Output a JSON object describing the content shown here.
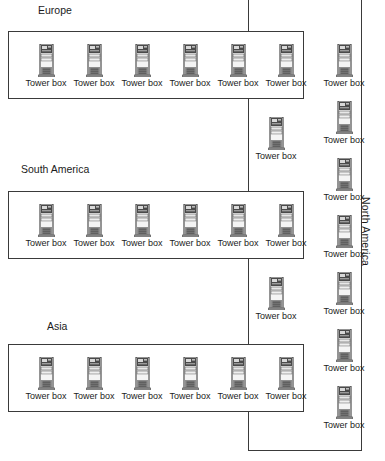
{
  "diagram": {
    "node_icon": "tower-box-icon",
    "node_label": "Tower box",
    "line_color": "#3a3a3a",
    "background": "#ffffff"
  },
  "north_america": {
    "label": "North America",
    "orientation": "vertical",
    "box": {
      "left": 248,
      "top": 0,
      "width": 114,
      "height": 451
    },
    "label_pos": {
      "x": 372,
      "y": 197
    },
    "right_column_nodes": [
      {
        "label": "Tower box",
        "x": 316,
        "y": 44
      },
      {
        "label": "Tower box",
        "x": 316,
        "y": 101
      },
      {
        "label": "Tower box",
        "x": 316,
        "y": 158
      },
      {
        "label": "Tower box",
        "x": 316,
        "y": 215
      },
      {
        "label": "Tower box",
        "x": 316,
        "y": 272
      },
      {
        "label": "Tower box",
        "x": 316,
        "y": 329
      },
      {
        "label": "Tower box",
        "x": 316,
        "y": 386
      }
    ],
    "middle_column_nodes": [
      {
        "label": "Tower box",
        "x": 248,
        "y": 117
      },
      {
        "label": "Tower box",
        "x": 248,
        "y": 277
      }
    ]
  },
  "regions": [
    {
      "name": "Europe",
      "title_pos": {
        "x": 38,
        "y": 4
      },
      "box": {
        "left": 8,
        "top": 31,
        "width": 296,
        "height": 68
      },
      "nodes": [
        {
          "label": "Tower box",
          "x": 9
        },
        {
          "label": "Tower box",
          "x": 57
        },
        {
          "label": "Tower box",
          "x": 105
        },
        {
          "label": "Tower box",
          "x": 153
        },
        {
          "label": "Tower box",
          "x": 201
        },
        {
          "label": "Tower box",
          "x": 249
        }
      ]
    },
    {
      "name": "South America",
      "title_pos": {
        "x": 21,
        "y": 163
      },
      "box": {
        "left": 8,
        "top": 191,
        "width": 296,
        "height": 68
      },
      "nodes": [
        {
          "label": "Tower box",
          "x": 9
        },
        {
          "label": "Tower box",
          "x": 57
        },
        {
          "label": "Tower box",
          "x": 105
        },
        {
          "label": "Tower box",
          "x": 153
        },
        {
          "label": "Tower box",
          "x": 201
        },
        {
          "label": "Tower box",
          "x": 249
        }
      ]
    },
    {
      "name": "Asia",
      "title_pos": {
        "x": 47,
        "y": 320
      },
      "box": {
        "left": 8,
        "top": 344,
        "width": 296,
        "height": 68
      },
      "nodes": [
        {
          "label": "Tower box",
          "x": 9
        },
        {
          "label": "Tower box",
          "x": 57
        },
        {
          "label": "Tower box",
          "x": 105
        },
        {
          "label": "Tower box",
          "x": 153
        },
        {
          "label": "Tower box",
          "x": 201
        },
        {
          "label": "Tower box",
          "x": 249
        }
      ]
    }
  ]
}
